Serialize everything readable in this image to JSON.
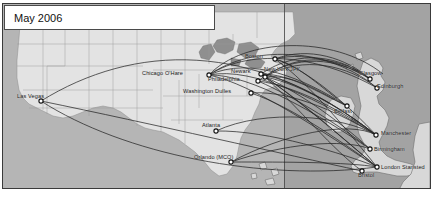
{
  "figure": {
    "name": "airline-route-map",
    "title": "May 2006",
    "region_note": ""
  },
  "title_card": {
    "label": "May 2006"
  },
  "colors": {
    "ocean_left": "#b5b5b5",
    "ocean_right": "#a3a3a3",
    "land_us": "#e3e3e3",
    "land_uk": "#d8d8d8",
    "route_line": "#1b1b1b",
    "node_fill": "#ffffff",
    "node_stroke": "#101010",
    "frame": "#3a3a3a",
    "label_text": "#1a1a1a",
    "card_background": "#ffffff"
  },
  "map": {
    "airports": [
      {
        "name": "Las Vegas",
        "label": "Las Vegas",
        "x": 38,
        "y": 97,
        "label_x": 14,
        "label_y": 89,
        "side": "left"
      },
      {
        "name": "Chicago O'Hare",
        "label": "Chicago O'Hare",
        "x": 206,
        "y": 71,
        "label_x": 139,
        "label_y": 66,
        "side": "left"
      },
      {
        "name": "Washington Dulles",
        "label": "Washington Dulles",
        "x": 248,
        "y": 89,
        "label_x": 180,
        "label_y": 84,
        "side": "left"
      },
      {
        "name": "Philadelphia",
        "label": "Philadelphia",
        "x": 255,
        "y": 77,
        "label_x": 205,
        "label_y": 72,
        "side": "left"
      },
      {
        "name": "Newark",
        "label": "Newark",
        "x": 258,
        "y": 70,
        "label_x": 228,
        "label_y": 64,
        "side": "left"
      },
      {
        "name": "New York JFK",
        "label": "New York JFK",
        "x": 262,
        "y": 73,
        "label_x": 261,
        "label_y": 62,
        "side": "right"
      },
      {
        "name": "Boston",
        "label": "Boston",
        "x": 272,
        "y": 55,
        "label_x": 242,
        "label_y": 49,
        "side": "left"
      },
      {
        "name": "Atlanta",
        "label": "Atlanta",
        "x": 213,
        "y": 127,
        "label_x": 199,
        "label_y": 118,
        "side": "left"
      },
      {
        "name": "Orlando (MCO)",
        "label": "Orlando (MCO)",
        "x": 228,
        "y": 158,
        "label_x": 191,
        "label_y": 150,
        "side": "left"
      },
      {
        "name": "Glasgow",
        "label": "Glasgow",
        "x": 367,
        "y": 75,
        "label_x": 356,
        "label_y": 66,
        "side": "left"
      },
      {
        "name": "Edinburgh",
        "label": "Edinburgh",
        "x": 374,
        "y": 84,
        "label_x": 374,
        "label_y": 79,
        "side": "right"
      },
      {
        "name": "Belfast",
        "label": "Belfast",
        "x": 344,
        "y": 102,
        "label_x": 331,
        "label_y": 104,
        "side": "left"
      },
      {
        "name": "Manchester",
        "label": "Manchester",
        "x": 373,
        "y": 131,
        "label_x": 378,
        "label_y": 126,
        "side": "right"
      },
      {
        "name": "Birmingham",
        "label": "Birmingham",
        "x": 367,
        "y": 145,
        "label_x": 371,
        "label_y": 142,
        "side": "right"
      },
      {
        "name": "London Stansted",
        "label": "London Stansted",
        "x": 374,
        "y": 163,
        "label_x": 378,
        "label_y": 160,
        "side": "right"
      },
      {
        "name": "Bristol",
        "label": "Bristol",
        "x": 359,
        "y": 167,
        "label_x": 355,
        "label_y": 168,
        "side": "left"
      }
    ],
    "route_count": 34,
    "meridian_x": 281
  },
  "chart_data": {
    "type": "map",
    "title": "May 2006",
    "us_airports": [
      "Las Vegas",
      "Chicago O'Hare",
      "Washington Dulles",
      "Philadelphia",
      "Newark",
      "New York JFK",
      "Boston",
      "Atlanta",
      "Orlando (MCO)"
    ],
    "uk_airports": [
      "Glasgow",
      "Edinburgh",
      "Belfast",
      "Manchester",
      "Birmingham",
      "London Stansted",
      "Bristol"
    ],
    "routes": [
      {
        "from": "Las Vegas",
        "to": "London Stansted"
      },
      {
        "from": "Las Vegas",
        "to": "Manchester"
      },
      {
        "from": "Chicago O'Hare",
        "to": "Glasgow"
      },
      {
        "from": "Chicago O'Hare",
        "to": "Edinburgh"
      },
      {
        "from": "Chicago O'Hare",
        "to": "Belfast"
      },
      {
        "from": "Chicago O'Hare",
        "to": "Manchester"
      },
      {
        "from": "Chicago O'Hare",
        "to": "Birmingham"
      },
      {
        "from": "Chicago O'Hare",
        "to": "London Stansted"
      },
      {
        "from": "Boston",
        "to": "Glasgow"
      },
      {
        "from": "Boston",
        "to": "Edinburgh"
      },
      {
        "from": "Boston",
        "to": "Belfast"
      },
      {
        "from": "Boston",
        "to": "Manchester"
      },
      {
        "from": "Boston",
        "to": "London Stansted"
      },
      {
        "from": "New York JFK",
        "to": "Glasgow"
      },
      {
        "from": "New York JFK",
        "to": "Edinburgh"
      },
      {
        "from": "New York JFK",
        "to": "Belfast"
      },
      {
        "from": "New York JFK",
        "to": "Manchester"
      },
      {
        "from": "New York JFK",
        "to": "Birmingham"
      },
      {
        "from": "New York JFK",
        "to": "London Stansted"
      },
      {
        "from": "New York JFK",
        "to": "Bristol"
      },
      {
        "from": "Newark",
        "to": "Glasgow"
      },
      {
        "from": "Newark",
        "to": "Manchester"
      },
      {
        "from": "Newark",
        "to": "Belfast"
      },
      {
        "from": "Newark",
        "to": "London Stansted"
      },
      {
        "from": "Philadelphia",
        "to": "Glasgow"
      },
      {
        "from": "Philadelphia",
        "to": "Manchester"
      },
      {
        "from": "Philadelphia",
        "to": "Birmingham"
      },
      {
        "from": "Washington Dulles",
        "to": "Manchester"
      },
      {
        "from": "Washington Dulles",
        "to": "London Stansted"
      },
      {
        "from": "Atlanta",
        "to": "Manchester"
      },
      {
        "from": "Atlanta",
        "to": "London Stansted"
      },
      {
        "from": "Orlando (MCO)",
        "to": "Manchester"
      },
      {
        "from": "Orlando (MCO)",
        "to": "Birmingham"
      },
      {
        "from": "Orlando (MCO)",
        "to": "London Stansted"
      }
    ]
  }
}
